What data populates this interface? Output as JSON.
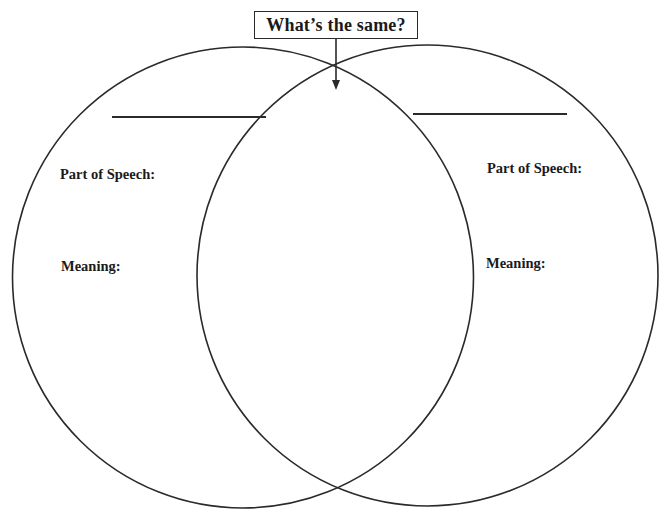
{
  "header": {
    "title": "What’s the same?"
  },
  "left_circle": {
    "word_blank": "",
    "part_of_speech_label": "Part of Speech:",
    "meaning_label": "Meaning:"
  },
  "right_circle": {
    "word_blank": "",
    "part_of_speech_label": "Part of Speech:",
    "meaning_label": "Meaning:"
  },
  "overlap": {
    "label_target": "What’s the same?"
  },
  "colors": {
    "stroke": "#2a2a2a",
    "background": "#ffffff",
    "text": "#1a1a1a"
  }
}
